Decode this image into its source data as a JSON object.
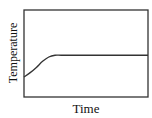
{
  "chart_data": {
    "type": "line",
    "title": "",
    "xlabel": "Time",
    "ylabel": "Temperature",
    "x_ticks": [],
    "y_ticks": [],
    "grid": false,
    "legend": null,
    "xlim": [
      0,
      1
    ],
    "ylim": [
      0,
      1
    ],
    "series": [
      {
        "name": "temperature",
        "color": "#333333",
        "x": [
          0.0,
          0.05,
          0.1,
          0.15,
          0.2,
          0.25,
          0.3,
          0.4,
          0.6,
          0.8,
          1.0
        ],
        "y": [
          0.23,
          0.28,
          0.34,
          0.41,
          0.46,
          0.48,
          0.48,
          0.48,
          0.48,
          0.48,
          0.48
        ]
      }
    ],
    "annotations": []
  },
  "labels": {
    "x": "Time",
    "y": "Temperature"
  }
}
